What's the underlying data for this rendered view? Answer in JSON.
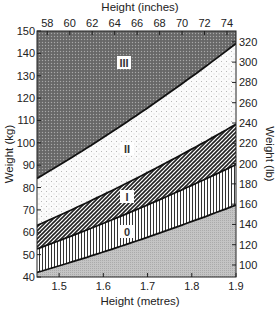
{
  "chart_data": {
    "type": "area",
    "title": "",
    "xlabel": "Height (metres)",
    "xlabel_top": "Height (inches)",
    "ylabel": "Weight (kg)",
    "ylabel_right": "Weight (lb)",
    "xlim": [
      1.45,
      1.9
    ],
    "ylim": [
      40,
      150
    ],
    "x_ticks": [
      "1.5",
      "1.6",
      "1.7",
      "1.8",
      "1.9"
    ],
    "x_top_ticks": [
      "58",
      "60",
      "62",
      "64",
      "66",
      "68",
      "70",
      "72",
      "74"
    ],
    "y_ticks": [
      "40",
      "50",
      "60",
      "70",
      "80",
      "90",
      "100",
      "110",
      "120",
      "130",
      "140",
      "150"
    ],
    "y_right_ticks": [
      "100",
      "120",
      "140",
      "160",
      "180",
      "200",
      "220",
      "240",
      "260",
      "280",
      "300",
      "320"
    ],
    "grid": false,
    "legend": null,
    "regions": [
      {
        "name": "0",
        "lower_bmi": 20,
        "upper_bmi": 25,
        "pattern": "vertical-lines"
      },
      {
        "name": "I",
        "lower_bmi": 25,
        "upper_bmi": 30,
        "pattern": "diagonal-hatch"
      },
      {
        "name": "II",
        "lower_bmi": 30,
        "upper_bmi": 40,
        "pattern": "light-dots"
      },
      {
        "name": "III",
        "lower_bmi": 40,
        "upper_bmi": null,
        "pattern": "dark-stipple"
      }
    ],
    "series": [
      {
        "name": "boundary below 0",
        "x": [
          1.45,
          1.9
        ],
        "values": [
          42.1,
          72.2
        ]
      },
      {
        "name": "boundary 0/I",
        "x": [
          1.45,
          1.9
        ],
        "values": [
          52.6,
          90.3
        ]
      },
      {
        "name": "boundary I/II",
        "x": [
          1.45,
          1.9
        ],
        "values": [
          63.1,
          108.3
        ]
      },
      {
        "name": "boundary II/III",
        "x": [
          1.45,
          1.9
        ],
        "values": [
          84.1,
          144.4
        ]
      }
    ],
    "annotations": [
      "III",
      "II",
      "I",
      "0"
    ]
  }
}
